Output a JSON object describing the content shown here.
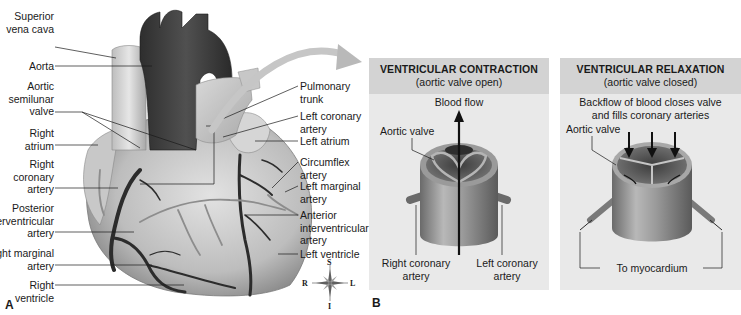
{
  "figure": {
    "panel_a": {
      "letter": "A",
      "labels_left": [
        {
          "id": "superior-vena-cava",
          "text": "Superior\nvena cava"
        },
        {
          "id": "aorta",
          "text": "Aorta"
        },
        {
          "id": "aortic-semilunar-valve",
          "text": "Aortic\nsemilunar\nvalve"
        },
        {
          "id": "right-atrium",
          "text": "Right\natrium"
        },
        {
          "id": "right-coronary-artery",
          "text": "Right\ncoronary\nartery"
        },
        {
          "id": "posterior-interventricular-artery",
          "text": "Posterior\ninterventricular\nartery"
        },
        {
          "id": "right-marginal-artery",
          "text": "Right marginal\nartery"
        },
        {
          "id": "right-ventricle",
          "text": "Right ventricle"
        }
      ],
      "labels_right": [
        {
          "id": "pulmonary-trunk",
          "text": "Pulmonary\ntrunk"
        },
        {
          "id": "left-coronary-artery",
          "text": "Left coronary\nartery"
        },
        {
          "id": "left-atrium",
          "text": "Left atrium"
        },
        {
          "id": "circumflex-artery",
          "text": "Circumflex\nartery"
        },
        {
          "id": "left-marginal-artery",
          "text": "Left marginal\nartery"
        },
        {
          "id": "anterior-interventricular-artery",
          "text": "Anterior\ninterventricular\nartery"
        },
        {
          "id": "left-ventricle",
          "text": "Left ventricle"
        }
      ],
      "compass": {
        "top": "S",
        "bottom": "I",
        "left": "R",
        "right": "L"
      }
    },
    "panel_b": {
      "letter": "B",
      "contraction": {
        "title": "VENTRICULAR CONTRACTION",
        "subtitle": "(aortic valve open)",
        "flow_label": "Blood flow",
        "valve_label": "Aortic valve",
        "right_coronary_label": "Right coronary\nartery",
        "left_coronary_label": "Left coronary\nartery"
      },
      "relaxation": {
        "title": "VENTRICULAR RELAXATION",
        "subtitle": "(aortic valve closed)",
        "description": "Backflow of blood closes valve\nand fills coronary arteries",
        "valve_label": "Aortic valve",
        "myocardium_label": "To myocardium"
      }
    },
    "colors": {
      "box_bg": "#e9e9e9",
      "box_header": "#d3d3d3",
      "heart_dark": "#3a3a3a",
      "heart_mid": "#9a9a9a",
      "heart_light": "#cfcfcf"
    }
  }
}
